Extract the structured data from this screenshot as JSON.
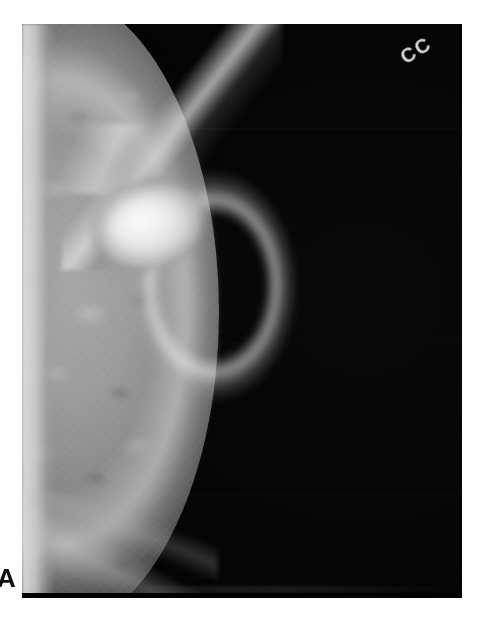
{
  "figure": {
    "panel_label": "A",
    "modality": "mammogram",
    "background_color": "#ffffff"
  },
  "radiograph": {
    "view_marker": "CC",
    "view_marker_meaning": "cranio-caudal",
    "film_background_color": "#000000",
    "plate": {
      "left": 22,
      "top": 24,
      "width": 440,
      "height": 574
    },
    "findings": {
      "mass_label": "",
      "parenchyma_label": "",
      "chest_wall_label": ""
    },
    "tones": {
      "film_black": "#000000",
      "parenchyma_gray": "#9a9a9a",
      "mass_white": "#f4f4f4",
      "skin_line": "#dedede",
      "marker_text": "#e9e9e9"
    }
  },
  "bottom_bar": {
    "color": "#000000"
  }
}
